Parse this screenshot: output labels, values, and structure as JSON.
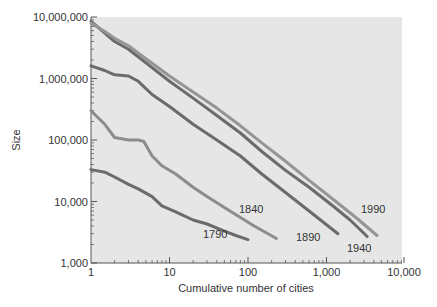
{
  "chart_data": {
    "type": "line",
    "title": "",
    "xlabel": "Cumulative number of cities",
    "ylabel": "Size",
    "xscale": "log",
    "yscale": "log",
    "xlim": [
      1,
      10000
    ],
    "ylim": [
      1000,
      10000000
    ],
    "x_ticks": [
      1,
      10,
      100,
      1000,
      10000
    ],
    "x_tick_labels": [
      "1",
      "10",
      "100",
      "1,000",
      "10,000"
    ],
    "y_ticks": [
      1000,
      10000,
      100000,
      1000000,
      10000000
    ],
    "y_tick_labels": [
      "1,000",
      "10,000",
      "100,000",
      "1,000,000",
      "10,000,000"
    ],
    "grid": false,
    "legend": "inline labels near line ends",
    "series": [
      {
        "name": "1790",
        "color": "#6b6b6b",
        "x": [
          1,
          1.5,
          2,
          3,
          4,
          6,
          8,
          12,
          20,
          30,
          50,
          70,
          100
        ],
        "y": [
          33000,
          30000,
          25000,
          19000,
          16000,
          12000,
          8500,
          6800,
          5000,
          4300,
          3300,
          2800,
          2400
        ]
      },
      {
        "name": "1840",
        "color": "#8c8c8c",
        "x": [
          1,
          1.5,
          2,
          3,
          4,
          4.7,
          6,
          8,
          12,
          20,
          30,
          50,
          80,
          120,
          180,
          230
        ],
        "y": [
          300000,
          180000,
          110000,
          100000,
          100000,
          95000,
          55000,
          38000,
          28000,
          17000,
          12000,
          8000,
          5500,
          4000,
          3000,
          2500
        ]
      },
      {
        "name": "1890",
        "color": "#6b6b6b",
        "x": [
          1,
          1.5,
          2,
          3,
          4,
          6,
          10,
          20,
          40,
          80,
          150,
          300,
          600,
          1000,
          1400
        ],
        "y": [
          1600000,
          1350000,
          1150000,
          1100000,
          900000,
          550000,
          350000,
          180000,
          100000,
          55000,
          28000,
          14000,
          7000,
          4200,
          3000
        ]
      },
      {
        "name": "1940",
        "color": "#6b6b6b",
        "x": [
          1,
          1.5,
          2,
          3,
          5,
          10,
          20,
          40,
          80,
          150,
          300,
          600,
          1200,
          2000,
          3300
        ],
        "y": [
          8500000,
          5500000,
          4000000,
          3000000,
          1800000,
          900000,
          480000,
          250000,
          130000,
          65000,
          32000,
          17000,
          8500,
          5000,
          2700
        ]
      },
      {
        "name": "1990",
        "color": "#959595",
        "x": [
          1,
          1.5,
          2,
          3,
          5,
          10,
          20,
          40,
          80,
          150,
          300,
          600,
          1200,
          2500,
          4400
        ],
        "y": [
          8000000,
          5800000,
          4500000,
          3400000,
          2100000,
          1100000,
          600000,
          330000,
          170000,
          90000,
          45000,
          22000,
          11000,
          5200,
          2800
        ]
      }
    ]
  }
}
